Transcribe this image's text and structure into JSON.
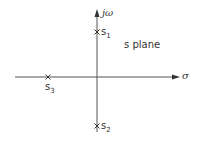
{
  "diagram": {
    "type": "pole-zero plot",
    "plane_label": "s plane",
    "axes": {
      "horizontal_label": "σ",
      "vertical_label": "jω"
    },
    "poles": [
      {
        "name": "s",
        "subscript": "1",
        "location": "positive imaginary axis",
        "marker": "×"
      },
      {
        "name": "s",
        "subscript": "2",
        "location": "negative imaginary axis",
        "marker": "×"
      },
      {
        "name": "s",
        "subscript": "3",
        "location": "negative real axis",
        "marker": "×"
      }
    ],
    "colors": {
      "line": "#555555",
      "text": "#333333"
    }
  }
}
